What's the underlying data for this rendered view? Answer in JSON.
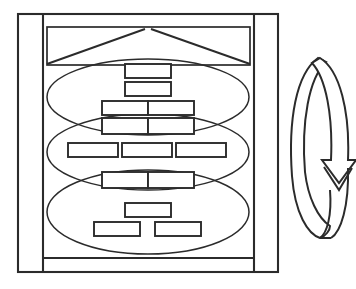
{
  "document": {
    "title": "Layered Hierarchy Diagram with Cyclic Arrow",
    "background_color": "#ffffff",
    "stroke_color": "#2b2b2b",
    "width": 356,
    "height": 289
  },
  "frame": {
    "name": "outer-frame",
    "x": 18,
    "y": 14,
    "width": 260,
    "height": 258,
    "left_divider_x": 43,
    "right_divider_x": 254
  },
  "banner": {
    "name": "top-banner",
    "x": 47,
    "y": 27,
    "width": 203,
    "height": 38,
    "chevron_apex_x": 148,
    "chevron_apex_y": 29
  },
  "ellipses": [
    {
      "name": "ellipse-top",
      "label": "Tier 1",
      "cx": 148,
      "cy": 97,
      "rx": 101,
      "ry": 38
    },
    {
      "name": "ellipse-middle",
      "label": "Tier 2",
      "cx": 148,
      "cy": 152,
      "rx": 101,
      "ry": 38
    },
    {
      "name": "ellipse-bottom",
      "label": "Tier 3",
      "cx": 148,
      "cy": 212,
      "rx": 101,
      "ry": 42
    }
  ],
  "nodes": [
    {
      "name": "node-t1-a",
      "group": "tier1",
      "row": 1,
      "x": 125,
      "y": 64,
      "width": 46,
      "height": 14
    },
    {
      "name": "node-t1-b",
      "group": "tier1",
      "row": 2,
      "x": 125,
      "y": 82,
      "width": 46,
      "height": 14
    },
    {
      "name": "node-t1-c",
      "group": "tier1",
      "row": 3,
      "x": 102,
      "y": 101,
      "width": 46,
      "height": 14
    },
    {
      "name": "node-t1-d",
      "group": "tier1",
      "row": 3,
      "x": 148,
      "y": 101,
      "width": 46,
      "height": 14
    },
    {
      "name": "node-t2-a",
      "group": "tier2",
      "row": 1,
      "x": 102,
      "y": 118,
      "width": 46,
      "height": 16
    },
    {
      "name": "node-t2-b",
      "group": "tier2",
      "row": 1,
      "x": 148,
      "y": 118,
      "width": 46,
      "height": 16
    },
    {
      "name": "node-t2-c",
      "group": "tier2",
      "row": 2,
      "x": 68,
      "y": 143,
      "width": 50,
      "height": 14
    },
    {
      "name": "node-t2-d",
      "group": "tier2",
      "row": 2,
      "x": 122,
      "y": 143,
      "width": 50,
      "height": 14
    },
    {
      "name": "node-t2-e",
      "group": "tier2",
      "row": 2,
      "x": 176,
      "y": 143,
      "width": 50,
      "height": 14
    },
    {
      "name": "node-t3-a",
      "group": "tier3",
      "row": 1,
      "x": 102,
      "y": 172,
      "width": 46,
      "height": 16
    },
    {
      "name": "node-t3-b",
      "group": "tier3",
      "row": 1,
      "x": 148,
      "y": 172,
      "width": 46,
      "height": 16
    },
    {
      "name": "node-t3-c",
      "group": "tier3",
      "row": 2,
      "x": 125,
      "y": 203,
      "width": 46,
      "height": 14
    },
    {
      "name": "node-t3-d",
      "group": "tier3",
      "row": 3,
      "x": 94,
      "y": 222,
      "width": 46,
      "height": 14
    },
    {
      "name": "node-t3-e",
      "group": "tier3",
      "row": 3,
      "x": 155,
      "y": 222,
      "width": 46,
      "height": 14
    }
  ],
  "cycle_arrow": {
    "name": "cyclic-loop-arrow",
    "direction": "down",
    "center_x": 320,
    "top_y": 58,
    "bottom_y": 238,
    "arrowhead_y": 150,
    "description": "Closed elliptical loop arrow with downward arrowhead"
  },
  "legend": {
    "icon_names": [
      "outer-frame-icon",
      "chevron-banner-icon",
      "ellipse-tier-icon",
      "node-box-icon",
      "cyclic-arrow-icon"
    ]
  }
}
